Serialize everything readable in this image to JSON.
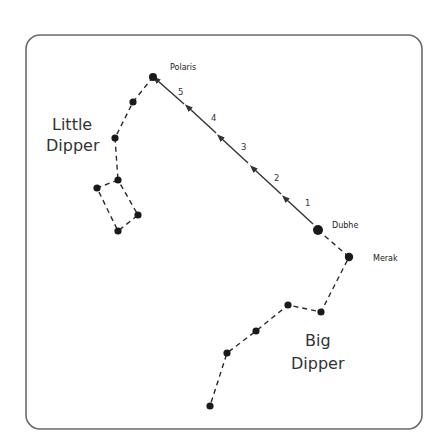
{
  "labels": {
    "polaris": "Polaris",
    "dubhe": "Dubhe",
    "merak": "Merak",
    "little_dipper_line1": "Little",
    "little_dipper_line2": "Dipper",
    "big_dipper_line1": "Big",
    "big_dipper_line2": "Dipper"
  },
  "pointer_steps": [
    "1",
    "2",
    "3",
    "4",
    "5"
  ],
  "colors": {
    "frame": "#6b6b6b",
    "star": "#1a1a1a",
    "line": "#333333",
    "background": "#ffffff"
  },
  "constellations": {
    "little_dipper": {
      "name": "Little Dipper",
      "stars": [
        [
          153,
          77
        ],
        [
          133,
          102
        ],
        [
          115,
          138
        ],
        [
          118,
          180
        ],
        [
          97,
          188
        ],
        [
          118,
          231
        ],
        [
          138,
          215
        ]
      ]
    },
    "big_dipper": {
      "name": "Big Dipper",
      "stars": [
        [
          318,
          230
        ],
        [
          349,
          257
        ],
        [
          321,
          312
        ],
        [
          288,
          305
        ],
        [
          256,
          331
        ],
        [
          227,
          353
        ],
        [
          210,
          406
        ]
      ]
    }
  }
}
